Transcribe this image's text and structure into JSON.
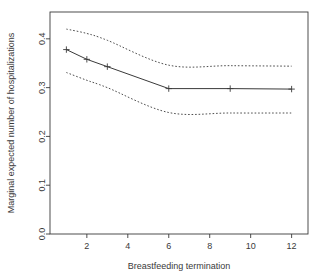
{
  "chart_data": {
    "type": "line",
    "title": "",
    "subtitle": "",
    "xlabel": "Breastfeeding termination",
    "ylabel": "Marginal expected number of hospitalizations",
    "xlim": [
      0.2,
      12.8
    ],
    "ylim": [
      0.0,
      0.455
    ],
    "xticks": [
      2,
      4,
      6,
      8,
      10,
      12
    ],
    "xtick_labels": [
      "2",
      "4",
      "6",
      "8",
      "10",
      "12"
    ],
    "yticks": [
      0.0,
      0.1,
      0.2,
      0.3,
      0.4
    ],
    "ytick_labels": [
      "0.0",
      "0.1",
      "0.2",
      "0.3",
      "0.4"
    ],
    "grid": false,
    "legend": "none",
    "box": true,
    "x": [
      1,
      2,
      3,
      6,
      9,
      12
    ],
    "series": [
      {
        "name": "Marginal expected number of hospitalizations",
        "style": "solid",
        "marker": "plus",
        "color": "#3a3a3a",
        "values": [
          0.378,
          0.358,
          0.343,
          0.298,
          0.298,
          0.297
        ]
      },
      {
        "name": "Upper confidence limit",
        "style": "dotted",
        "marker": "none",
        "color": "#3a3a3a",
        "values": [
          0.42,
          0.411,
          0.397,
          0.346,
          0.345,
          0.344
        ]
      },
      {
        "name": "Lower confidence limit",
        "style": "dotted",
        "marker": "none",
        "color": "#3a3a3a",
        "values": [
          0.331,
          0.315,
          0.3,
          0.249,
          0.248,
          0.248
        ]
      }
    ]
  },
  "axes": {
    "x_title": "Breastfeeding termination",
    "y_title": "Marginal expected number of hospitalizations"
  }
}
